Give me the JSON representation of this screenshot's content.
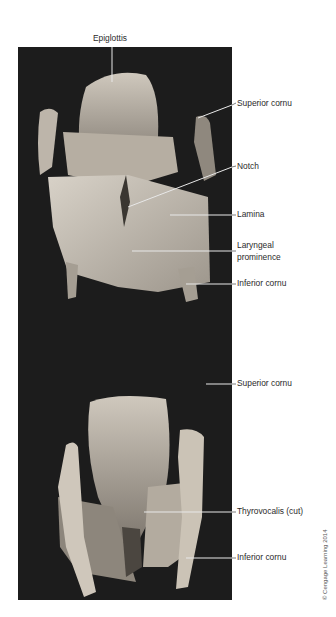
{
  "figure": {
    "top_panel": {
      "labels": [
        {
          "id": "epiglottis",
          "text": "Epiglottis"
        },
        {
          "id": "superior-cornu",
          "text": "Superior cornu"
        },
        {
          "id": "notch",
          "text": "Notch"
        },
        {
          "id": "lamina",
          "text": "Lamina"
        },
        {
          "id": "laryngeal-prominence-1",
          "text": "Laryngeal"
        },
        {
          "id": "laryngeal-prominence-2",
          "text": "prominence"
        },
        {
          "id": "inferior-cornu",
          "text": "Inferior cornu"
        }
      ]
    },
    "bottom_panel": {
      "labels": [
        {
          "id": "superior-cornu",
          "text": "Superior cornu"
        },
        {
          "id": "thyrovocalis",
          "text": "Thyrovocalis (cut)"
        },
        {
          "id": "inferior-cornu",
          "text": "Inferior cornu"
        }
      ]
    },
    "credit": "© Cengage Learning 2014",
    "colors": {
      "photo_background": "#1c1c1c",
      "tissue": "#cfc7bb",
      "label_text": "#2b2b2b",
      "leader_line": "#e8e8e8"
    }
  }
}
